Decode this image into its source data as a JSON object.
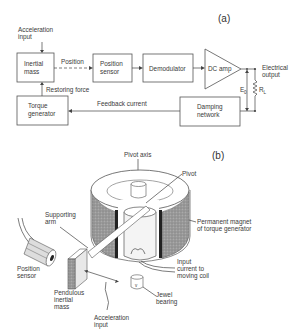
{
  "figure": {
    "panel_a": {
      "label": "(a)",
      "blocks": {
        "inertial_mass": [
          "Inertial",
          "mass"
        ],
        "position_sensor": [
          "Position",
          "sensor"
        ],
        "demodulator": [
          "Demodulator"
        ],
        "dc_amp": [
          "DC amp"
        ],
        "torque_generator": [
          "Torque",
          "generator"
        ],
        "damping_network": [
          "Damping",
          "network"
        ]
      },
      "signals": {
        "acceleration_input": [
          "Acceleration",
          "input"
        ],
        "position": "Position",
        "restoring_force": "Restoring force",
        "feedback_current": "Feedback current",
        "electrical_output": [
          "Electrical",
          "output"
        ],
        "e0": "E",
        "e0_sub": "0",
        "rl": "R",
        "rl_sub": "L"
      }
    },
    "panel_b": {
      "label": "(b)",
      "labels": {
        "pivot_axis": "Pivot axis",
        "pivot": "Pivot",
        "permanent_magnet": [
          "Permanent magnet",
          "of torque generator"
        ],
        "supporting_arm": [
          "Supporting",
          "arm"
        ],
        "position_sensor": [
          "Position",
          "sensor"
        ],
        "input_current": [
          "Input",
          "current to",
          "moving coil"
        ],
        "pendulous_mass": [
          "Pendulous",
          "inertial",
          "mass"
        ],
        "jewel_bearing": [
          "Jewel",
          "bearing"
        ],
        "acceleration_input": [
          "Acceleration",
          "input"
        ]
      }
    }
  }
}
